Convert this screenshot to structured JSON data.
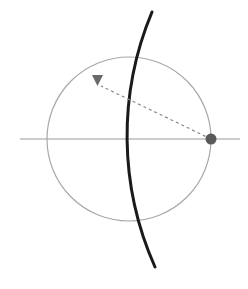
{
  "figure": {
    "title": "",
    "width": 248,
    "height": 289,
    "background_color": "#ffffff"
  },
  "chart_data": {
    "type": "scatter",
    "title": "",
    "xlabel": "",
    "ylabel": "",
    "xlim": [
      0,
      248
    ],
    "ylim": [
      289,
      0
    ],
    "grid": false,
    "legend": null,
    "coordinate_note": "All values are in pixel coordinates of the 248x289 image, origin top-left, y increasing downward.",
    "elements": [
      {
        "name": "horizontal-axis-line",
        "kind": "line",
        "x1": 20,
        "y1": 139,
        "x2": 240,
        "y2": 139,
        "color": "#999999",
        "stroke_width": 1,
        "dash": "solid"
      },
      {
        "name": "light-circle",
        "kind": "circle",
        "cx": 129,
        "cy": 139,
        "r": 82,
        "stroke_color": "#a8a8a8",
        "stroke_width": 1.2,
        "fill": "none"
      },
      {
        "name": "dark-arc",
        "kind": "arc",
        "cx": 393,
        "cy": 139,
        "r": 321,
        "start_point": [
          152,
          12
        ],
        "end_point": [
          155,
          267
        ],
        "leftmost_point": [
          72,
          139
        ],
        "stroke_color": "#1a1a1a",
        "stroke_width": 3,
        "fill": "none"
      },
      {
        "name": "dashed-ray",
        "kind": "line",
        "x1": 211,
        "y1": 139,
        "x2": 101,
        "y2": 86,
        "color": "#8a8a8a",
        "stroke_width": 1.2,
        "dash": "3,3"
      },
      {
        "name": "source-dot",
        "kind": "point",
        "x": 211,
        "y": 139,
        "r": 5.5,
        "fill": "#5a5a5a",
        "marker": "filled-circle"
      },
      {
        "name": "arrow-marker",
        "kind": "marker",
        "x": 97,
        "y": 80,
        "size": 11,
        "fill": "#6a6a6a",
        "marker": "triangle-down",
        "vertices": [
          [
            92,
            75
          ],
          [
            103,
            75
          ],
          [
            97.5,
            86
          ]
        ]
      }
    ],
    "series": [
      {
        "name": "source-dot",
        "x": [
          211
        ],
        "y": [
          139
        ]
      },
      {
        "name": "arrow-marker",
        "x": [
          97.5
        ],
        "y": [
          80
        ]
      }
    ]
  },
  "colors": {
    "background": "#ffffff",
    "dark_arc": "#1a1a1a",
    "light_circle": "#a8a8a8",
    "axis_line": "#999999",
    "dashed_ray": "#8a8a8a",
    "dot_fill": "#5a5a5a",
    "arrow_fill": "#6a6a6a"
  }
}
